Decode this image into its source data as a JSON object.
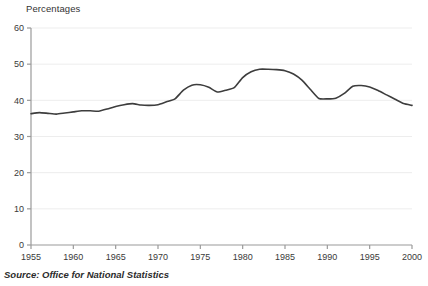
{
  "chart_data": {
    "type": "line",
    "title": "",
    "ylabel": "Percentages",
    "xlabel": "",
    "ylim": [
      0,
      60
    ],
    "xlim": [
      1955,
      2000
    ],
    "grid": true,
    "legend": null,
    "yticks": [
      0,
      10,
      20,
      30,
      40,
      50,
      60
    ],
    "xticks": [
      1955,
      1960,
      1965,
      1970,
      1975,
      1980,
      1985,
      1990,
      1995,
      2000
    ],
    "series": [
      {
        "name": "Percentage",
        "color": "#3d3d3d",
        "x": [
          1955,
          1956,
          1957,
          1958,
          1959,
          1960,
          1961,
          1962,
          1963,
          1964,
          1965,
          1966,
          1967,
          1968,
          1969,
          1970,
          1971,
          1972,
          1973,
          1974,
          1975,
          1976,
          1977,
          1978,
          1979,
          1980,
          1981,
          1982,
          1983,
          1984,
          1985,
          1986,
          1987,
          1988,
          1989,
          1990,
          1991,
          1992,
          1993,
          1994,
          1995,
          1996,
          1997,
          1998,
          1999,
          2000
        ],
        "values": [
          36.3,
          36.6,
          36.4,
          36.2,
          36.5,
          36.8,
          37.1,
          37.1,
          37.0,
          37.6,
          38.3,
          38.8,
          39.1,
          38.7,
          38.6,
          38.8,
          39.6,
          40.4,
          42.8,
          44.2,
          44.3,
          43.6,
          42.3,
          42.8,
          43.5,
          46.3,
          47.9,
          48.6,
          48.6,
          48.5,
          48.2,
          47.3,
          45.6,
          43.0,
          40.5,
          40.4,
          40.6,
          41.9,
          43.9,
          44.1,
          43.7,
          42.7,
          41.5,
          40.3,
          39.1,
          38.6
        ]
      }
    ]
  },
  "footer": {
    "source": "Source: Office for National Statistics"
  },
  "axes": {
    "y_axis_title": "Percentages"
  }
}
